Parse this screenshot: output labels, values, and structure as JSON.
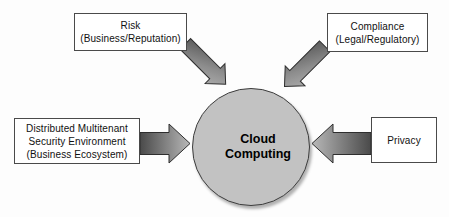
{
  "diagram": {
    "center": {
      "name": "cloud-computing",
      "label_line1": "Cloud",
      "label_line2": "Computing",
      "shape": "circle",
      "fill_color": "#c2c2c2",
      "stroke_color": "#3d3d3d"
    },
    "nodes": [
      {
        "name": "risk",
        "position": "top-left",
        "line1": "Risk",
        "line2": "(Business/Reputation)"
      },
      {
        "name": "compliance",
        "position": "top-right",
        "line1": "Compliance",
        "line2": "(Legal/Regulatory)"
      },
      {
        "name": "distributed-multitenant-security-environment",
        "position": "left",
        "line1": "Distributed Multitenant",
        "line2": "Security Environment",
        "line3": "(Business Ecosystem)"
      },
      {
        "name": "privacy",
        "position": "right",
        "line1": "Privacy"
      }
    ],
    "arrows": [
      {
        "name": "arrow-risk-to-cloud",
        "from": "risk",
        "to": "cloud-computing",
        "direction": "down-right"
      },
      {
        "name": "arrow-compliance-to-cloud",
        "from": "compliance",
        "to": "cloud-computing",
        "direction": "down-left"
      },
      {
        "name": "arrow-dmse-to-cloud",
        "from": "distributed-multitenant-security-environment",
        "to": "cloud-computing",
        "direction": "right"
      },
      {
        "name": "arrow-privacy-to-cloud",
        "from": "privacy",
        "to": "cloud-computing",
        "direction": "left"
      }
    ],
    "colors": {
      "background": "#fdfdfd",
      "box_fill": "#ffffff",
      "box_stroke": "#4a4a4a",
      "arrow_dark": "#525252",
      "arrow_light": "#a8a8a8",
      "arrow_stroke": "#2e2e2e",
      "text": "#111111"
    }
  }
}
